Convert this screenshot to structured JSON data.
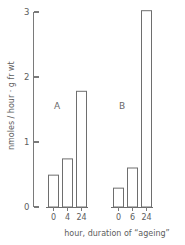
{
  "chart_data": {
    "type": "bar",
    "title": "",
    "subtitle": "",
    "xlabel": "hour, duration of “ageing”",
    "ylabel": "nmoles / hour · g fr wt",
    "ylim": [
      0,
      3
    ],
    "y_ticks": [
      0,
      1,
      2,
      3
    ],
    "y_tick_labels": [
      "0",
      "1",
      "2",
      "3"
    ],
    "grid": false,
    "legend": "none",
    "bar_style": "open-outline",
    "panels": [
      {
        "name": "A",
        "label": "A",
        "categories": [
          "0",
          "4",
          "24"
        ],
        "values": [
          0.49,
          0.74,
          1.78
        ]
      },
      {
        "name": "B",
        "label": "B",
        "categories": [
          "0",
          "6",
          "24"
        ],
        "values": [
          0.29,
          0.6,
          3.02
        ]
      }
    ]
  },
  "colors": {
    "background": "#ffffff",
    "axis": "#7a7a7a",
    "bar_stroke": "#6e6e6e",
    "bar_fill": "#ffffff",
    "text": "#5d5d5d"
  }
}
